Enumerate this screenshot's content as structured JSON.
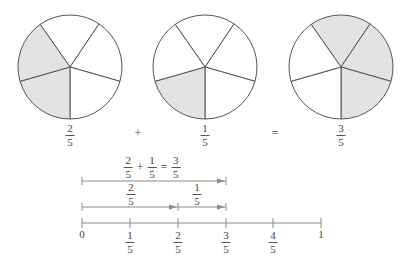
{
  "pies": [
    {
      "id": "pie-two-fifths",
      "label": {
        "num": "2",
        "den": "5"
      },
      "slices": 5,
      "shaded": [
        3,
        4
      ]
    },
    {
      "id": "pie-one-fifth",
      "label": {
        "num": "1",
        "den": "5"
      },
      "slices": 5,
      "shaded": [
        3
      ]
    },
    {
      "id": "pie-three-fifths",
      "label": {
        "num": "3",
        "den": "5"
      },
      "slices": 5,
      "shaded": [
        0,
        1,
        2
      ]
    }
  ],
  "operators": {
    "plus": "+",
    "equals": "="
  },
  "equation": {
    "a": {
      "num": "2",
      "den": "5"
    },
    "plus": "+",
    "b": {
      "num": "1",
      "den": "5"
    },
    "equals": "=",
    "result": {
      "num": "3",
      "den": "5"
    }
  },
  "segments": {
    "first": {
      "num": "2",
      "den": "5"
    },
    "second": {
      "num": "1",
      "den": "5"
    }
  },
  "number_line": {
    "ticks": [
      {
        "type": "whole",
        "text": "0"
      },
      {
        "type": "frac",
        "num": "1",
        "den": "5"
      },
      {
        "type": "frac",
        "num": "2",
        "den": "5"
      },
      {
        "type": "frac",
        "num": "3",
        "den": "5"
      },
      {
        "type": "frac",
        "num": "4",
        "den": "5"
      },
      {
        "type": "whole",
        "text": "1"
      }
    ]
  },
  "colors": {
    "shade": "#e3e3e3",
    "stroke": "#555555",
    "line": "#888888"
  }
}
